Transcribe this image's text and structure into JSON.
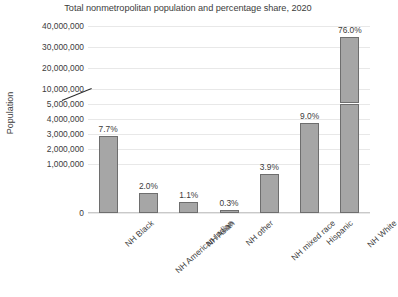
{
  "chart_data": {
    "type": "bar",
    "title": "Total nonmetropolitan population and percentage share, 2020",
    "xlabel": "",
    "ylabel": "Population",
    "grid": true,
    "legend": false,
    "axis_break": {
      "present": true,
      "below_range": [
        0,
        5000000
      ],
      "above_range": [
        10000000,
        40000000
      ],
      "note": "y-axis is broken between 5,000,000 and 10,000,000"
    },
    "ylim": [
      0,
      40000000
    ],
    "ytick_labels": [
      "40,000,000",
      "30,000,000",
      "20,000,000",
      "10,000,000",
      "5,000,000",
      "4,000,000",
      "3,000,000",
      "2,000,000",
      "1,000,000",
      "0"
    ],
    "ytick_values": [
      40000000,
      30000000,
      20000000,
      10000000,
      5000000,
      4000000,
      3000000,
      2000000,
      1000000,
      0
    ],
    "categories": [
      "NH Black",
      "NH American Indian",
      "NH Asian",
      "NH other",
      "NH mixed race",
      "Hispanic",
      "NH White"
    ],
    "values": [
      3550000,
      920000,
      510000,
      140000,
      1800000,
      4150000,
      35000000
    ],
    "data_labels": [
      "7.7%",
      "2.0%",
      "1.1%",
      "0.3%",
      "3.9%",
      "9.0%",
      "76.0%"
    ],
    "colors": {
      "bar_fill": "#a6a6a6",
      "bar_border": "#6e6e6e",
      "gridline": "#e8e8e8",
      "text": "#3c3c3c",
      "background": "#ffffff"
    }
  }
}
